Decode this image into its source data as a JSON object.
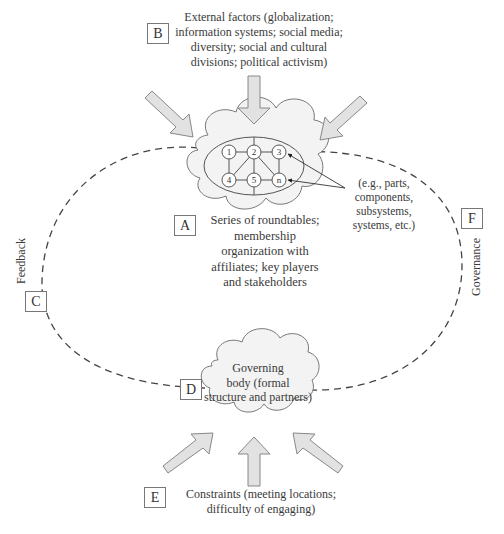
{
  "figure": {
    "type": "conceptual-diagram",
    "colors": {
      "arrow_fill": "#e2e2e2",
      "arrow_stroke": "#888888",
      "cloud_fill": "#f3f3f3",
      "cloud_stroke": "#777777",
      "dashed_line": "#444444",
      "text": "#3a3a3a"
    }
  },
  "labels": {
    "A": "A",
    "B": "B",
    "C": "C",
    "D": "D",
    "E": "E",
    "F": "F"
  },
  "text": {
    "external_factors": "External factors (globalization;\ninformation systems; social media;\ndiversity; social and cultural\ndivisions; political activism)",
    "roundtables": "Series of roundtables;\nmembership\norganization with\naffiliates; key players\nand stakeholders",
    "examples": "(e.g., parts,\ncomponents,\nsubsystems,\nsystems, etc.)",
    "governing_body": "Governing\nbody (formal\nstructure and partners)",
    "constraints": "Constraints (meeting locations;\ndifficulty of engaging)",
    "feedback": "Feedback",
    "governance": "Governance"
  },
  "network": {
    "nodes": [
      "1",
      "2",
      "3",
      "4",
      "5",
      "n"
    ]
  }
}
